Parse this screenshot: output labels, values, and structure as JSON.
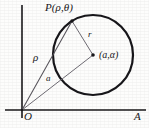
{
  "figure": {
    "kind": "polar-coordinate-circle-diagram",
    "background_color": "#fdfdfc",
    "ink_color": "#18171a",
    "thin_line_color": "#6f6c70",
    "labels": {
      "point_P": "P(ρ,θ)",
      "radius_r": "r",
      "center": "(a,α)",
      "segment_rho": "ρ",
      "segment_a": "a",
      "origin": "O",
      "polar_axis": "A"
    },
    "geometry": {
      "vertical_axis": {
        "x": 22,
        "y_top": 5,
        "y_bottom": 118
      },
      "horizontal_axis": {
        "y": 110,
        "x_left": 5,
        "x_right": 146
      },
      "circle": {
        "cx": 93,
        "cy": 55,
        "r": 40,
        "stroke_width": 2.1
      },
      "origin_point": {
        "x": 22,
        "y": 110
      },
      "point_P": {
        "x": 72,
        "y": 21
      },
      "center_point": {
        "x": 93,
        "y": 55,
        "dot_radius": 1.8
      },
      "segment_rho": {
        "from": [
          22,
          110
        ],
        "to": [
          72,
          21
        ]
      },
      "segment_a": {
        "from": [
          22,
          110
        ],
        "to": [
          93,
          55
        ]
      },
      "segment_r": {
        "from": [
          93,
          55
        ],
        "to": [
          72,
          21
        ]
      }
    }
  }
}
